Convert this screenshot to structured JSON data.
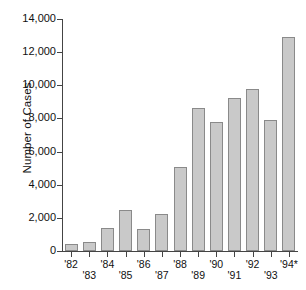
{
  "chart_data": {
    "type": "bar",
    "title": "",
    "xlabel": "",
    "ylabel": "Number of Cases",
    "categories": [
      "'82",
      "'83",
      "'84",
      "'85",
      "'86",
      "'87",
      "'88",
      "'89",
      "'90",
      "'91",
      "'92",
      "'93",
      "'94*"
    ],
    "values": [
      450,
      550,
      1400,
      2450,
      1350,
      2250,
      5050,
      8650,
      7800,
      9250,
      9750,
      7900,
      12900
    ],
    "ylim": [
      0,
      14000
    ],
    "ytick_labels": [
      "0",
      "2,000",
      "4,000",
      "6,000",
      "8,000",
      "10,000",
      "12,000",
      "14,000"
    ],
    "ytick_values": [
      0,
      2000,
      4000,
      6000,
      8000,
      10000,
      12000,
      14000
    ],
    "grid": false,
    "legend": null,
    "bar_color": "#c9c9c9",
    "bar_edge_color": "#8a8a8a",
    "axis_color": "#444444",
    "text_color": "#111111",
    "note": "'94* label carries an asterisk",
    "xlabel_stagger": [
      "top",
      "bottom",
      "top",
      "bottom",
      "top",
      "bottom",
      "top",
      "bottom",
      "top",
      "bottom",
      "top",
      "bottom",
      "top"
    ]
  }
}
